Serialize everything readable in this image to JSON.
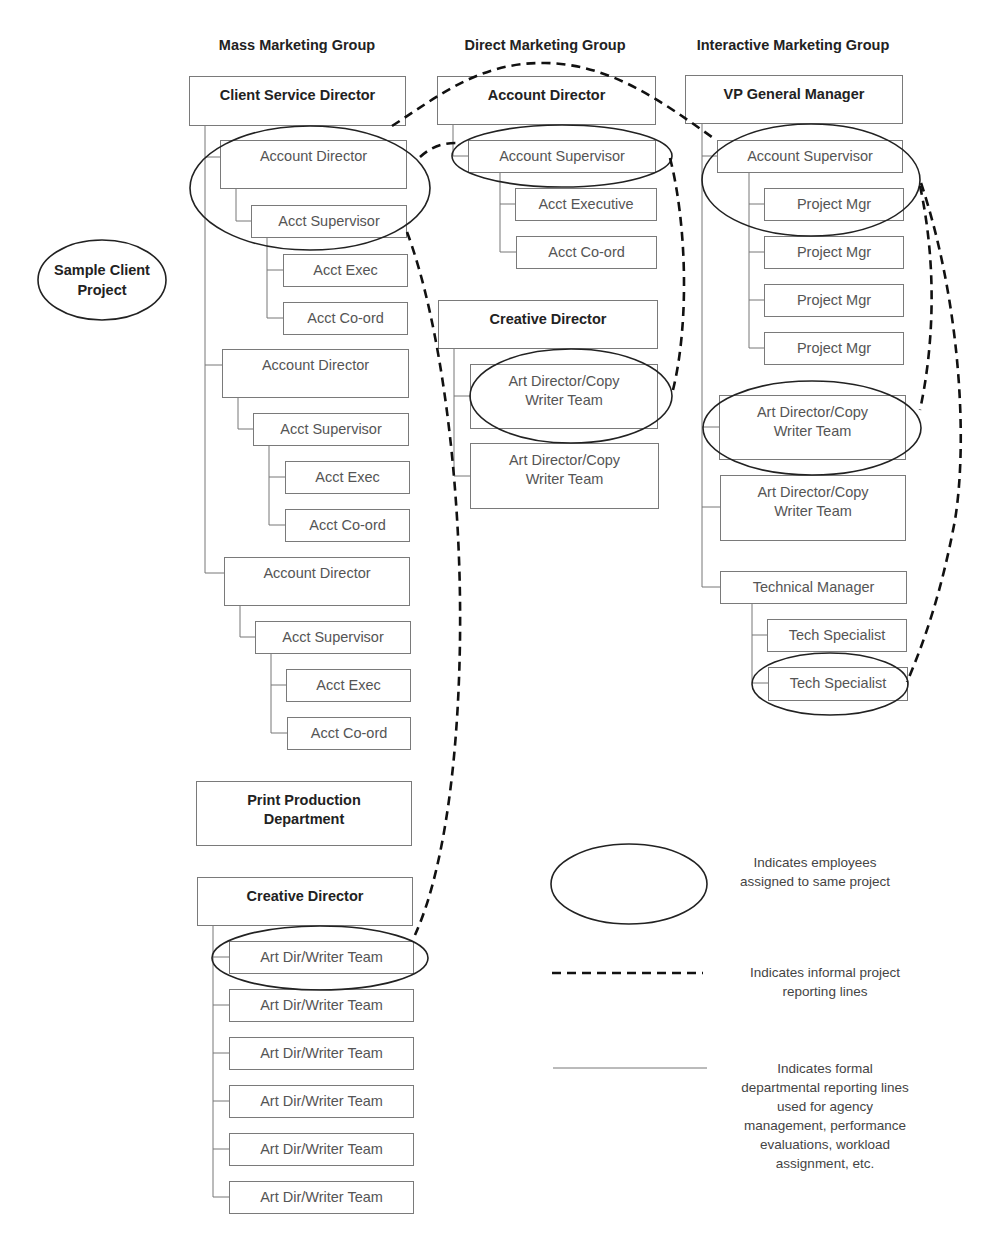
{
  "groups": {
    "mass": "Mass Marketing Group",
    "direct": "Direct Marketing Group",
    "interactive": "Interactive Marketing Group"
  },
  "sample_client": {
    "line1": "Sample Client",
    "line2": "Project"
  },
  "mass": {
    "head": "Client Service Director",
    "units": [
      {
        "director": "Account Director",
        "supervisor": "Acct Supervisor",
        "exec": "Acct Exec",
        "coord": "Acct Co-ord"
      },
      {
        "director": "Account Director",
        "supervisor": "Acct Supervisor",
        "exec": "Acct Exec",
        "coord": "Acct Co-ord"
      },
      {
        "director": "Account Director",
        "supervisor": "Acct Supervisor",
        "exec": "Acct Exec",
        "coord": "Acct Co-ord"
      }
    ],
    "print_production": {
      "line1": "Print Production",
      "line2": "Department"
    },
    "creative_director": "Creative Director",
    "teams": [
      "Art Dir/Writer Team",
      "Art Dir/Writer Team",
      "Art Dir/Writer Team",
      "Art Dir/Writer Team",
      "Art Dir/Writer Team",
      "Art Dir/Writer Team"
    ]
  },
  "direct": {
    "head": "Account Director",
    "supervisor": "Account Supervisor",
    "exec": "Acct Executive",
    "coord": "Acct Co-ord",
    "creative_director": "Creative Director",
    "teams": [
      {
        "line1": "Art Director/Copy",
        "line2": "Writer Team"
      },
      {
        "line1": "Art Director/Copy",
        "line2": "Writer Team"
      }
    ]
  },
  "interactive": {
    "head": "VP General Manager",
    "supervisor": "Account Supervisor",
    "project_mgrs": [
      "Project Mgr",
      "Project Mgr",
      "Project Mgr",
      "Project Mgr"
    ],
    "teams": [
      {
        "line1": "Art Director/Copy",
        "line2": "Writer Team"
      },
      {
        "line1": "Art Director/Copy",
        "line2": "Writer Team"
      }
    ],
    "tech_manager": "Technical Manager",
    "tech_specialists": [
      "Tech Specialist",
      "Tech Specialist"
    ]
  },
  "legend": {
    "ellipse": {
      "line1": "Indicates employees",
      "line2": "assigned to same project"
    },
    "dashed": {
      "line1": "Indicates informal project",
      "line2": "reporting lines"
    },
    "solid": {
      "line1": "Indicates formal",
      "line2": "departmental reporting lines",
      "line3": "used for agency",
      "line4": "management, performance",
      "line5": "evaluations, workload",
      "line6": "assignment, etc."
    }
  },
  "colors": {
    "box_border": "#7a7a7a",
    "connector": "#777777",
    "ellipse": "#222222",
    "dashed": "#111111",
    "text": "#555555",
    "heading": "#222222"
  }
}
